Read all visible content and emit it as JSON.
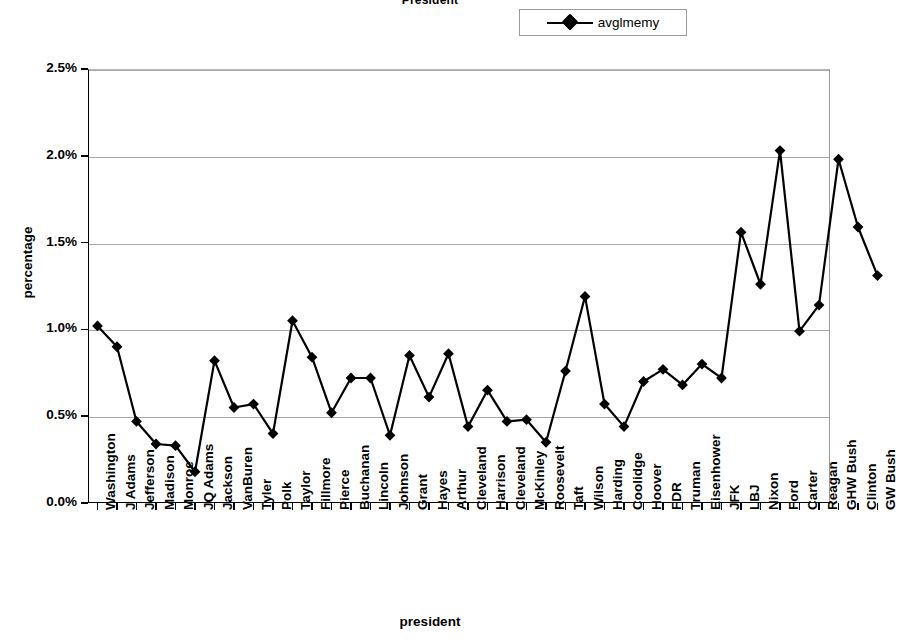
{
  "chart": {
    "title": "President",
    "xlabel": "president",
    "ylabel": "percentage"
  },
  "legend": {
    "position": "top-right",
    "entries": [
      {
        "label": "avglmemy",
        "marker": "diamond",
        "color": "#000000"
      }
    ]
  },
  "y_axis": {
    "tick_labels": [
      "2.5%",
      "2.0%",
      "1.5%",
      "1.0%",
      "0.5%",
      "0.0%"
    ]
  },
  "colors": {
    "series": "#000000",
    "gridline": "#a8a8a8",
    "axis": "#000000",
    "background": "#ffffff"
  },
  "chart_data": {
    "type": "line",
    "title": "President",
    "xlabel": "president",
    "ylabel": "percentage",
    "ylim": [
      0.0,
      2.5
    ],
    "yticks": [
      0.0,
      0.5,
      1.0,
      1.5,
      2.0,
      2.5
    ],
    "ytick_format": "percent",
    "grid": "horizontal",
    "legend_position": "top-right",
    "marker": "diamond",
    "categories": [
      "Washington",
      "J Adams",
      "Jefferson",
      "Madison",
      "Monroe",
      "JQ Adams",
      "Jackson",
      "VanBuren",
      "Tyler",
      "Polk",
      "Taylor",
      "Fillmore",
      "Pierce",
      "Buchanan",
      "Lincoln",
      "Johnson",
      "Grant",
      "Hayes",
      "Arthur",
      "Cleveland",
      "Harrison",
      "Cleveland",
      "McKinley",
      "Roosevelt",
      "Taft",
      "Wilson",
      "Harding",
      "Coolidge",
      "Hoover",
      "FDR",
      "Truman",
      "Eisenhower",
      "JFK",
      "LBJ",
      "Nixon",
      "Ford",
      "Carter",
      "Reagan",
      "GHW Bush",
      "Clinton",
      "GW Bush"
    ],
    "series": [
      {
        "name": "avglmemy",
        "values": [
          1.02,
          0.9,
          0.47,
          0.34,
          0.33,
          0.18,
          0.82,
          0.55,
          0.57,
          0.4,
          1.05,
          0.84,
          0.52,
          0.72,
          0.72,
          0.39,
          0.85,
          0.61,
          0.86,
          0.44,
          0.65,
          0.47,
          0.48,
          0.35,
          0.76,
          1.19,
          0.57,
          0.44,
          0.7,
          0.77,
          0.68,
          0.8,
          0.72,
          1.56,
          1.26,
          2.03,
          0.99,
          1.14,
          1.98,
          1.59,
          1.31
        ]
      }
    ]
  }
}
